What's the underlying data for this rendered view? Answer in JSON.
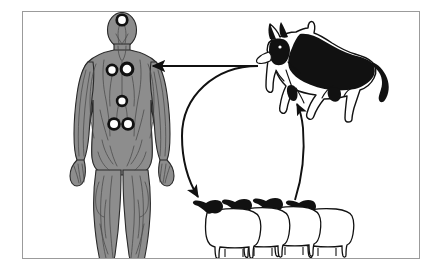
{
  "figure": {
    "kind": "diagram",
    "title": "",
    "caption": "",
    "background_color": "#ffffff",
    "border_color": "#9b9b9b"
  },
  "palette": {
    "body_gray": "#8d8d8d",
    "body_outline": "#2a2a2a",
    "body_detail": "#4a4a4a",
    "cyst_ring": "#111111",
    "cyst_fill": "#ffffff",
    "animal_black": "#111111",
    "animal_white": "#ffffff",
    "arrow_color": "#111111",
    "frame_color": "#9b9b9b"
  },
  "nodes": [
    {
      "id": "human",
      "data_name": "human-figure",
      "label": "",
      "description": "full-body anterior human figure shown in gray with internal vascular detail",
      "lesion_label": "",
      "lesion_groups": [
        {
          "region": "head",
          "count": 1,
          "arrangement": "single"
        },
        {
          "region": "chest",
          "count": 2,
          "arrangement": "pair"
        },
        {
          "region": "abdomen",
          "count": 1,
          "arrangement": "single"
        },
        {
          "region": "pelvis",
          "count": 2,
          "arrangement": "pair"
        }
      ],
      "lesion_total": 6
    },
    {
      "id": "dog",
      "data_name": "dog-figure",
      "label": "",
      "description": "german shepherd dog standing in left-facing profile, black saddle with white chest and legs",
      "species": "dog"
    },
    {
      "id": "sheep",
      "data_name": "sheep-group",
      "label": "",
      "description": "group of four sheep facing left, black heads and horns with white fleece bodies",
      "species": "sheep",
      "count": 4
    }
  ],
  "arrows": [
    {
      "id": "dog-to-human",
      "data_name": "arrow-dog-to-human",
      "from": "dog",
      "to": "human",
      "label": "",
      "shape": "straight-horizontal",
      "direction": "left"
    },
    {
      "id": "dog-to-sheep",
      "data_name": "arrow-dog-to-sheep",
      "from": "dog",
      "to": "sheep",
      "label": "",
      "shape": "large-arc-counterclockwise",
      "direction": "down-right"
    },
    {
      "id": "sheep-to-dog",
      "data_name": "arrow-sheep-to-dog",
      "from": "sheep",
      "to": "dog",
      "label": "",
      "shape": "curve",
      "direction": "up"
    }
  ]
}
